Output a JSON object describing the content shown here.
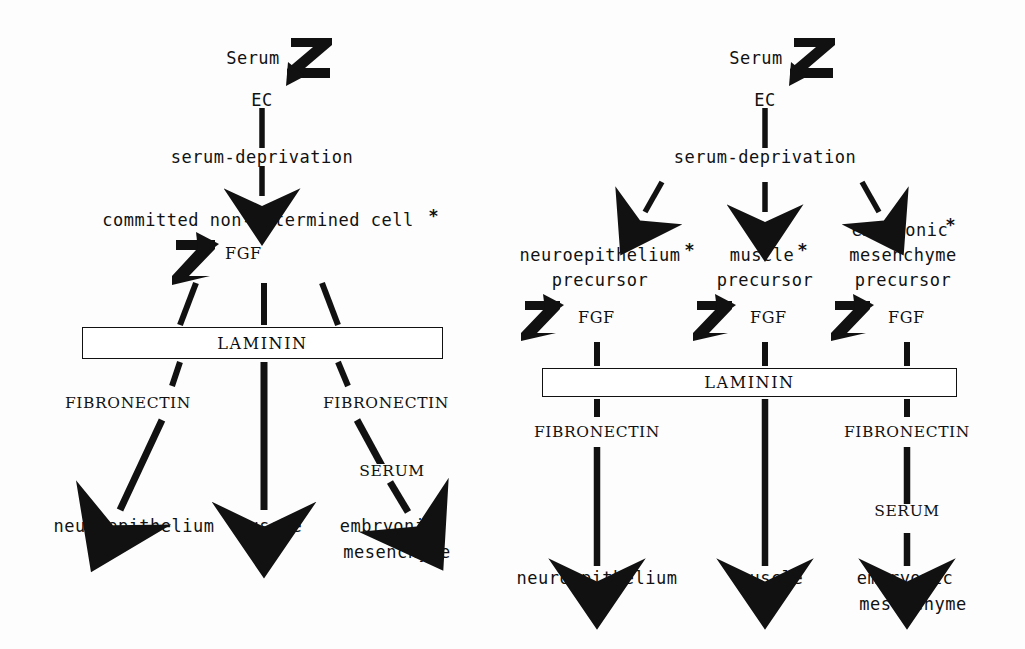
{
  "figure": {
    "type": "flow-diagram",
    "background_color": "#fdfdfd",
    "ink_color": "#111111"
  },
  "left_panel": {
    "nodes": {
      "serum": "Serum",
      "ec": "EC",
      "serum_deprivation": "serum-deprivation",
      "committed": "committed non-determined cell",
      "star": "*",
      "fgf": "FGF",
      "laminin": "LAMININ",
      "fibronectin_left": "FIBRONECTIN",
      "fibronectin_right": "FIBRONECTIN",
      "serum_label": "SERUM",
      "out_neuroepithelium": "neuroepithelium",
      "out_muscle": "muscle",
      "out_embryonic_line1": "embryonic",
      "out_embryonic_line2": "mesenchyme"
    }
  },
  "right_panel": {
    "nodes": {
      "serum": "Serum",
      "ec": "EC",
      "serum_deprivation": "serum-deprivation",
      "precursor_neuro_line1": "neuroepithelium",
      "precursor_neuro_star": "*",
      "precursor_neuro_line2": "precursor",
      "precursor_muscle_line1": "muscle",
      "precursor_muscle_star": "*",
      "precursor_muscle_line2": "precursor",
      "precursor_embryo_line1": "embryonic",
      "precursor_embryo_star": "*",
      "precursor_embryo_line2": "mesenchyme",
      "precursor_embryo_line3": "precursor",
      "fgf_left": "FGF",
      "fgf_mid": "FGF",
      "fgf_right": "FGF",
      "laminin": "LAMININ",
      "fibronectin_left": "FIBRONECTIN",
      "fibronectin_right": "FIBRONECTIN",
      "serum_label": "SERUM",
      "out_neuroepithelium": "neuroepithelium",
      "out_muscle": "muscle",
      "out_embryonic_line1": "embryonic",
      "out_embryonic_line2": "mesenchyme"
    }
  }
}
